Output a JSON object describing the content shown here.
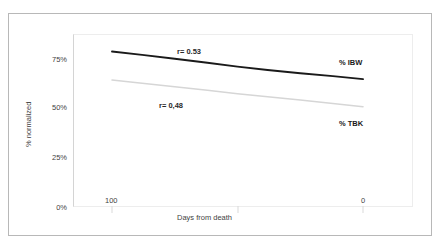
{
  "chart_data": {
    "type": "line",
    "title": "",
    "xlabel": "Days from death",
    "ylabel": "% normalized",
    "x": [
      100,
      0
    ],
    "xlim": [
      100,
      0
    ],
    "x_reversed": true,
    "xticks": [
      "100",
      "0"
    ],
    "ylim": [
      0,
      100
    ],
    "yticks": [
      "0%",
      "25%",
      "50%",
      "75%"
    ],
    "ytick_values": [
      0,
      25,
      50,
      75
    ],
    "grid": false,
    "legend": "inline-right",
    "series": [
      {
        "name": "% IBW",
        "label": "% IBW",
        "color": "#1a1a1a",
        "width": 1.9,
        "annotation": "r= 0.53",
        "x": [
          100,
          88,
          75,
          62,
          50,
          38,
          25,
          12,
          0
        ],
        "values": [
          78.3,
          76.6,
          74.6,
          72.6,
          70.6,
          68.9,
          67.3,
          65.8,
          64.3
        ]
      },
      {
        "name": "% TBK",
        "label": "% TBK",
        "color": "#d6d6d6",
        "width": 1.5,
        "annotation": "r= 0,48",
        "x": [
          100,
          88,
          75,
          62,
          50,
          38,
          25,
          12,
          0
        ],
        "values": [
          63.8,
          62.2,
          60.4,
          58.6,
          56.9,
          55.3,
          53.7,
          52.0,
          50.3
        ]
      }
    ]
  },
  "axes": {
    "ylabel": "% normalized",
    "xlabel": "Days from death",
    "yticks": [
      {
        "label": "75%"
      },
      {
        "label": "50%"
      },
      {
        "label": "25%"
      },
      {
        "label": "0%"
      }
    ],
    "xticks": [
      {
        "label": "100"
      },
      {
        "label": "0"
      }
    ]
  },
  "annotations": {
    "ibw_r": "r= 0.53",
    "tbk_r": "r= 0,48",
    "ibw_label": "% IBW",
    "tbk_label": "% TBK"
  },
  "colors": {
    "ibw_line": "#1a1a1a",
    "tbk_line": "#d6d6d6",
    "frame": "#b8b8b8",
    "plot_border": "#ededed",
    "text": "#3f3f3f",
    "background": "#ffffff"
  }
}
